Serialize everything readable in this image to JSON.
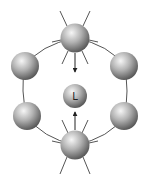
{
  "diagram": {
    "type": "ring-of-spheres-with-central-ligand",
    "center_label": "L",
    "ring": {
      "cx": 75,
      "cy": 91,
      "rx": 50,
      "ry": 56,
      "stroke": "#555555"
    },
    "spheres": [
      {
        "id": "top",
        "cx": 75,
        "cy": 38,
        "r": 14.5,
        "emitting": true
      },
      {
        "id": "upper-left",
        "cx": 25,
        "cy": 66,
        "r": 14,
        "emitting": false
      },
      {
        "id": "upper-right",
        "cx": 124,
        "cy": 66,
        "r": 14,
        "emitting": false
      },
      {
        "id": "lower-left",
        "cx": 27,
        "cy": 116,
        "r": 14,
        "emitting": false
      },
      {
        "id": "lower-right",
        "cx": 124,
        "cy": 116,
        "r": 14,
        "emitting": false
      },
      {
        "id": "bottom",
        "cx": 75,
        "cy": 145,
        "r": 14.5,
        "emitting": true
      }
    ],
    "center": {
      "cx": 75,
      "cy": 96,
      "r": 12
    },
    "arrows": [
      {
        "from": "top",
        "to": "center"
      },
      {
        "from": "bottom",
        "to": "center"
      }
    ],
    "colors": {
      "sphere_light": "#f4f4f4",
      "sphere_mid": "#a8a8a8",
      "sphere_dark": "#4a4a4a",
      "line": "#555555"
    }
  }
}
